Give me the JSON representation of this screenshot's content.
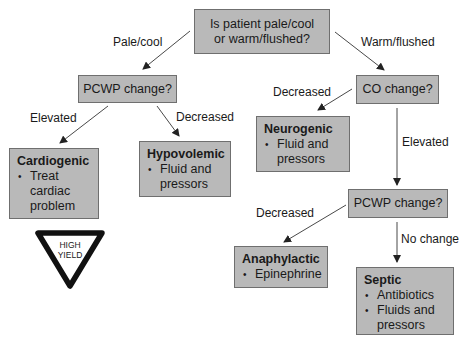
{
  "diagram": {
    "start": {
      "text": "Is patient pale/cool or warm/flushed?"
    },
    "edges": {
      "pale_cool": "Pale/cool",
      "warm_flushed": "Warm/flushed",
      "left_elevated": "Elevated",
      "left_decreased": "Decreased",
      "co_decreased": "Decreased",
      "co_elevated": "Elevated",
      "right_decreased": "Decreased",
      "right_no_change": "No change"
    },
    "nodes": {
      "pcwp_left": {
        "text": "PCWP change?"
      },
      "co_change": {
        "text": "CO change?"
      },
      "pcwp_right": {
        "text": "PCWP change?"
      },
      "cardiogenic": {
        "title": "Cardiogenic",
        "bullets": [
          "Treat cardiac problem"
        ]
      },
      "hypovolemic": {
        "title": "Hypovolemic",
        "bullets": [
          "Fluid and pressors"
        ]
      },
      "neurogenic": {
        "title": "Neurogenic",
        "bullets": [
          "Fluid and pressors"
        ]
      },
      "anaphylactic": {
        "title": "Anaphylactic",
        "bullets": [
          "Epinephrine"
        ]
      },
      "septic": {
        "title": "Septic",
        "bullets": [
          "Antibiotics",
          "Fluids and pressors"
        ]
      }
    },
    "badge": {
      "line1": "HIGH",
      "line2": "YIELD"
    },
    "colors": {
      "box_fill": "#b9b9b9",
      "box_border": "#6f6f6f",
      "line": "#333333"
    }
  }
}
